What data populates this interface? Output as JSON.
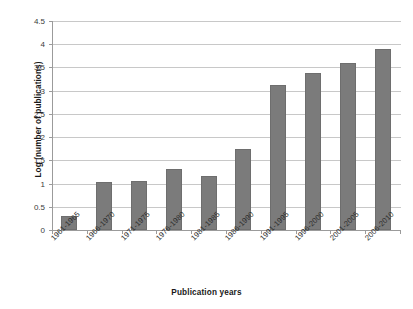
{
  "chart_data": {
    "type": "bar",
    "title": "",
    "xlabel": "Publication years",
    "ylabel": "Log (number of publications)",
    "categories": [
      "1961-1965",
      "1966-1970",
      "1971-1975",
      "1976-1980",
      "1981-1985",
      "1986-1990",
      "1991-1995",
      "1996-2000",
      "2001-2005",
      "2006-2010"
    ],
    "values": [
      0.3,
      1.04,
      1.05,
      1.32,
      1.17,
      1.74,
      3.12,
      3.37,
      3.59,
      3.89
    ],
    "ylim": [
      0,
      4.5
    ],
    "yticks": [
      "0",
      "0.5",
      "1",
      "1.5",
      "2",
      "2.5",
      "3",
      "3.5",
      "4",
      "4.5"
    ],
    "ytick_values": [
      0,
      0.5,
      1,
      1.5,
      2,
      2.5,
      3,
      3.5,
      4,
      4.5
    ],
    "grid": "horizontal",
    "legend": "none",
    "bar_color": "#7b7b7b",
    "gridline_color": "#c8c8c8",
    "axis_color": "#9b9b9b",
    "background_color": "#ffffff"
  }
}
